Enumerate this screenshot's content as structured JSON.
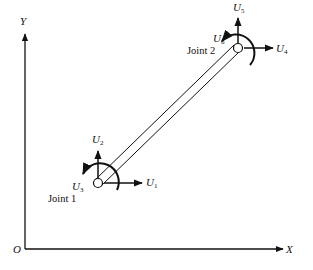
{
  "diagram": {
    "type": "beam-element-degrees-of-freedom",
    "axes": {
      "origin_label": "O",
      "x_label": "X",
      "y_label": "Y"
    },
    "joints": [
      {
        "label": "Joint 1",
        "dofs": [
          {
            "symbol": "U",
            "subscript": "1",
            "kind": "translation-x"
          },
          {
            "symbol": "U",
            "subscript": "2",
            "kind": "translation-y"
          },
          {
            "symbol": "U",
            "subscript": "3",
            "kind": "rotation"
          }
        ]
      },
      {
        "label": "Joint 2",
        "dofs": [
          {
            "symbol": "U",
            "subscript": "4",
            "kind": "translation-x"
          },
          {
            "symbol": "U",
            "subscript": "5",
            "kind": "translation-y"
          },
          {
            "symbol": "U",
            "subscript": "6",
            "kind": "rotation"
          }
        ]
      }
    ],
    "colors": {
      "ink": "#111111",
      "background": "#ffffff"
    }
  }
}
